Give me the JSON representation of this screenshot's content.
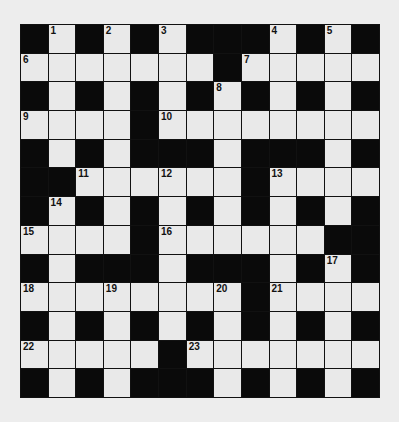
{
  "puzzle": {
    "rows": 13,
    "cols": 13,
    "colors": {
      "background": "#ededed",
      "white_cell": "#e9e9e9",
      "black_cell": "#0a0a0a",
      "grid_line": "#111111"
    },
    "grid": [
      [
        "#",
        "1",
        "#",
        "2",
        "#",
        "3",
        "#",
        "#",
        "#",
        "4",
        "#",
        "5",
        "#"
      ],
      [
        "6",
        ".",
        ".",
        ".",
        ".",
        ".",
        ".",
        "#",
        "7",
        ".",
        ".",
        ".",
        "."
      ],
      [
        "#",
        ".",
        "#",
        ".",
        "#",
        ".",
        "#",
        "8",
        "#",
        ".",
        "#",
        ".",
        "#"
      ],
      [
        "9",
        ".",
        ".",
        ".",
        "#",
        "10",
        ".",
        ".",
        ".",
        ".",
        ".",
        ".",
        "."
      ],
      [
        "#",
        ".",
        "#",
        ".",
        "#",
        "#",
        "#",
        ".",
        "#",
        "#",
        "#",
        ".",
        "#"
      ],
      [
        "#",
        "#",
        "11",
        ".",
        ".",
        "12",
        ".",
        ".",
        "#",
        "13",
        ".",
        ".",
        "."
      ],
      [
        "#",
        "14",
        "#",
        ".",
        "#",
        ".",
        "#",
        ".",
        "#",
        ".",
        "#",
        ".",
        "#"
      ],
      [
        "15",
        ".",
        ".",
        ".",
        "#",
        "16",
        ".",
        ".",
        ".",
        ".",
        ".",
        "#",
        "#"
      ],
      [
        "#",
        ".",
        "#",
        "#",
        "#",
        ".",
        "#",
        "#",
        "#",
        ".",
        "#",
        "17",
        "#"
      ],
      [
        "18",
        ".",
        ".",
        "19",
        ".",
        ".",
        ".",
        "20",
        "#",
        "21",
        ".",
        ".",
        "."
      ],
      [
        "#",
        ".",
        "#",
        ".",
        "#",
        ".",
        "#",
        ".",
        "#",
        ".",
        "#",
        ".",
        "#"
      ],
      [
        "22",
        ".",
        ".",
        ".",
        ".",
        "#",
        "23",
        ".",
        ".",
        ".",
        ".",
        ".",
        "."
      ],
      [
        "#",
        ".",
        "#",
        ".",
        "#",
        "#",
        "#",
        ".",
        "#",
        ".",
        "#",
        ".",
        "#"
      ]
    ]
  }
}
